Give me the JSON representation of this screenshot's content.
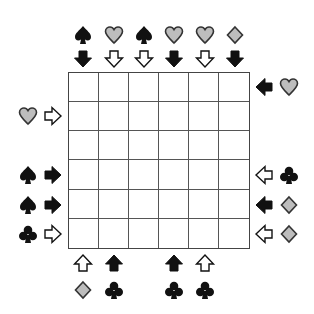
{
  "puzzle": {
    "rows": 6,
    "cols": 6,
    "colors": {
      "black": "#111111",
      "gray": "#bdbdbd",
      "outline": "#333333",
      "white": "#ffffff",
      "grid": "#444444"
    },
    "top": [
      {
        "col": 0,
        "symbol": "spade",
        "arrow": "down",
        "arrow_fill": "black"
      },
      {
        "col": 1,
        "symbol": "heart",
        "arrow": "down",
        "arrow_fill": "white"
      },
      {
        "col": 2,
        "symbol": "spade",
        "arrow": "down",
        "arrow_fill": "white"
      },
      {
        "col": 3,
        "symbol": "heart",
        "arrow": "down",
        "arrow_fill": "black"
      },
      {
        "col": 4,
        "symbol": "heart",
        "arrow": "down",
        "arrow_fill": "white"
      },
      {
        "col": 5,
        "symbol": "diamond",
        "arrow": "down",
        "arrow_fill": "black"
      }
    ],
    "right": [
      {
        "row": 0,
        "symbol": "heart",
        "arrow": "left",
        "arrow_fill": "black"
      },
      {
        "row": 3,
        "symbol": "club",
        "arrow": "left",
        "arrow_fill": "white"
      },
      {
        "row": 4,
        "symbol": "diamond",
        "arrow": "left",
        "arrow_fill": "black"
      },
      {
        "row": 5,
        "symbol": "diamond",
        "arrow": "left",
        "arrow_fill": "white"
      }
    ],
    "left": [
      {
        "row": 1,
        "symbol": "heart",
        "arrow": "right",
        "arrow_fill": "white"
      },
      {
        "row": 3,
        "symbol": "spade",
        "arrow": "right",
        "arrow_fill": "black"
      },
      {
        "row": 4,
        "symbol": "spade",
        "arrow": "right",
        "arrow_fill": "black"
      },
      {
        "row": 5,
        "symbol": "club",
        "arrow": "right",
        "arrow_fill": "white"
      }
    ],
    "bottom": [
      {
        "col": 0,
        "symbol": "diamond",
        "arrow": "up",
        "arrow_fill": "white"
      },
      {
        "col": 1,
        "symbol": "club",
        "arrow": "up",
        "arrow_fill": "black"
      },
      {
        "col": 3,
        "symbol": "club",
        "arrow": "up",
        "arrow_fill": "black"
      },
      {
        "col": 4,
        "symbol": "club",
        "arrow": "up",
        "arrow_fill": "white"
      }
    ]
  }
}
